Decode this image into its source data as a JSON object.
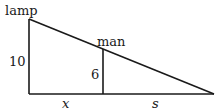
{
  "diagram": {
    "labels": {
      "lamp": "lamp",
      "man": "man",
      "lamp_height": "10",
      "man_height": "6",
      "distance_x": "x",
      "shadow_s": "s"
    },
    "colors": {
      "stroke": "#1a1a1a",
      "background": "#ffffff"
    }
  }
}
